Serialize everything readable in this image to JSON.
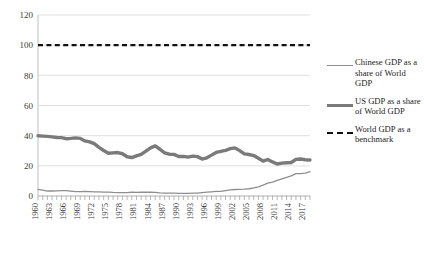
{
  "chart_data": {
    "type": "line",
    "title": "",
    "xlabel": "",
    "ylabel": "",
    "ylim": [
      0,
      120
    ],
    "ytick_values": [
      0,
      20,
      40,
      60,
      80,
      100,
      120
    ],
    "ytick_labels": [
      "0",
      "20",
      "40",
      "60",
      "80",
      "100",
      "120"
    ],
    "grid": true,
    "legend_position": "right",
    "x": [
      1960,
      1961,
      1962,
      1963,
      1964,
      1965,
      1966,
      1967,
      1968,
      1969,
      1970,
      1971,
      1972,
      1973,
      1974,
      1975,
      1976,
      1977,
      1978,
      1979,
      1980,
      1981,
      1982,
      1983,
      1984,
      1985,
      1986,
      1987,
      1988,
      1989,
      1990,
      1991,
      1992,
      1993,
      1994,
      1995,
      1996,
      1997,
      1998,
      1999,
      2000,
      2001,
      2002,
      2003,
      2004,
      2005,
      2006,
      2007,
      2008,
      2009,
      2010,
      2011,
      2012,
      2013,
      2014,
      2015,
      2016,
      2017,
      2018
    ],
    "xtick_labels": [
      "1960",
      "1963",
      "1966",
      "1969",
      "1972",
      "1975",
      "1978",
      "1981",
      "1984",
      "1987",
      "1990",
      "1993",
      "1996",
      "1999",
      "2002",
      "2005",
      "2008",
      "2011",
      "2014",
      "2017"
    ],
    "series": [
      {
        "name": "Chinese GDP as a share of World GDP",
        "style": "thin-solid",
        "color": "#8e8e8e",
        "values": [
          4.4,
          3.9,
          3.3,
          3.3,
          3.4,
          3.5,
          3.5,
          3.2,
          2.9,
          2.9,
          3.0,
          2.9,
          2.8,
          2.8,
          2.6,
          2.6,
          2.4,
          2.3,
          2.2,
          2.3,
          2.5,
          2.4,
          2.5,
          2.6,
          2.5,
          2.4,
          2.1,
          1.9,
          1.9,
          1.9,
          1.8,
          1.7,
          1.8,
          1.9,
          1.9,
          2.3,
          2.6,
          2.8,
          3.0,
          3.1,
          3.6,
          4.0,
          4.3,
          4.4,
          4.5,
          4.8,
          5.4,
          6.1,
          7.2,
          8.5,
          9.2,
          10.3,
          11.4,
          12.4,
          13.3,
          14.8,
          14.8,
          15.2,
          16.1
        ]
      },
      {
        "name": "US GDP as a share of World GDP",
        "style": "thick-solid",
        "color": "#7a7a7a",
        "values": [
          39.9,
          39.7,
          39.5,
          39.2,
          38.8,
          38.7,
          38.0,
          38.2,
          38.5,
          38.2,
          36.5,
          35.9,
          34.7,
          32.2,
          30.2,
          28.3,
          28.6,
          28.8,
          28.0,
          26.0,
          25.5,
          26.6,
          27.6,
          29.7,
          31.9,
          33.2,
          31.0,
          28.6,
          27.7,
          27.6,
          26.2,
          26.3,
          25.8,
          26.4,
          26.1,
          24.5,
          25.3,
          27.1,
          28.9,
          29.6,
          30.3,
          31.4,
          31.9,
          30.1,
          27.9,
          27.5,
          26.8,
          25.0,
          23.1,
          24.2,
          22.6,
          21.2,
          21.8,
          22.0,
          22.2,
          24.3,
          24.5,
          24.0,
          23.9
        ]
      },
      {
        "name": "World GDP as a benchmark",
        "style": "dashed",
        "color": "#111111",
        "values": [
          100,
          100,
          100,
          100,
          100,
          100,
          100,
          100,
          100,
          100,
          100,
          100,
          100,
          100,
          100,
          100,
          100,
          100,
          100,
          100,
          100,
          100,
          100,
          100,
          100,
          100,
          100,
          100,
          100,
          100,
          100,
          100,
          100,
          100,
          100,
          100,
          100,
          100,
          100,
          100,
          100,
          100,
          100,
          100,
          100,
          100,
          100,
          100,
          100,
          100,
          100,
          100,
          100,
          100,
          100,
          100,
          100,
          100,
          100
        ]
      }
    ]
  },
  "legend": {
    "items": [
      {
        "label": "Chinese GDP as a share of World GDP",
        "sample": "thin-line-sample"
      },
      {
        "label": "US GDP as a share of World GDP",
        "sample": "thick-line-sample"
      },
      {
        "label": "World GDP as a benchmark",
        "sample": "dashed-line-sample"
      }
    ]
  },
  "colors": {
    "chinese_line": "#8e8e8e",
    "us_line": "#7a7a7a",
    "benchmark_line": "#111111",
    "gridline": "#d9d9d9",
    "axis": "#bfbfbf",
    "text": "#1c1c1c"
  }
}
